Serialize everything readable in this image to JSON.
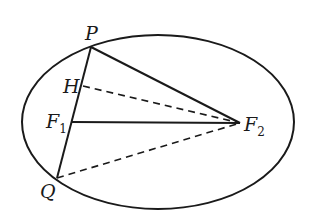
{
  "diagram": {
    "type": "ellipse-foci-geometry",
    "ellipse": {
      "cx": 158,
      "cy": 122,
      "rx": 136,
      "ry": 87
    },
    "points": {
      "P": {
        "label": "P",
        "sub": "",
        "x": 91,
        "y": 47
      },
      "H": {
        "label": "H",
        "sub": "",
        "x": 83,
        "y": 86
      },
      "F1": {
        "label": "F",
        "sub": "1",
        "x": 72,
        "y": 122
      },
      "F2": {
        "label": "F",
        "sub": "2",
        "x": 240,
        "y": 123
      },
      "Q": {
        "label": "Q",
        "sub": "",
        "x": 57,
        "y": 178
      }
    },
    "solid_segments": [
      "PQ",
      "PF2",
      "F1F2"
    ],
    "dashed_segments": [
      "HF2",
      "QF2"
    ],
    "colors": {
      "stroke": "#1a1a1a",
      "background": "#ffffff"
    }
  }
}
